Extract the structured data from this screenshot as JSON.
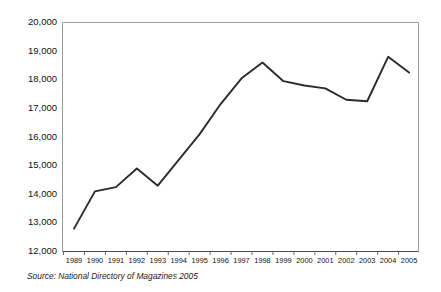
{
  "chart_data": {
    "type": "line",
    "title": "",
    "subtitle": "",
    "xlabel": "",
    "ylabel": "",
    "categories": [
      "1989",
      "1990",
      "1991",
      "1992",
      "1993",
      "1994",
      "1995",
      "1996",
      "1997",
      "1998",
      "1999",
      "2000",
      "2001",
      "2002",
      "2003",
      "2004",
      "2005"
    ],
    "values": [
      12800,
      14100,
      14250,
      14900,
      14300,
      15200,
      16100,
      17150,
      18050,
      18600,
      17950,
      17800,
      17700,
      17300,
      17250,
      18800,
      18250
    ],
    "series": [
      {
        "name": "Number of magazines",
        "values": [
          12800,
          14100,
          14250,
          14900,
          14300,
          15200,
          16100,
          17150,
          18050,
          18600,
          17950,
          17800,
          17700,
          17300,
          17250,
          18800,
          18250
        ]
      }
    ],
    "ylim": [
      12000,
      20000
    ],
    "ytick_labels": [
      "20,000",
      "19,000",
      "18,000",
      "17,000",
      "16,000",
      "15,000",
      "14,000",
      "13,000",
      "12,000"
    ],
    "ytick_values": [
      20000,
      19000,
      18000,
      17000,
      16000,
      15000,
      14000,
      13000,
      12000
    ],
    "xtick_labels": [
      "1989",
      "1990",
      "1991",
      "1992",
      "1993",
      "1994",
      "1995",
      "1996",
      "1997",
      "1998",
      "1999",
      "2000",
      "2001",
      "2002",
      "2003",
      "2004",
      "2005"
    ],
    "grid": false,
    "legend": false,
    "legend_position": "none",
    "line_color": "#2b2b2b",
    "frame_color": "#9a9a9a",
    "background_color": "#ffffff"
  },
  "annotations": {
    "source_note": "Source: National Directory of Magazines 2005"
  }
}
